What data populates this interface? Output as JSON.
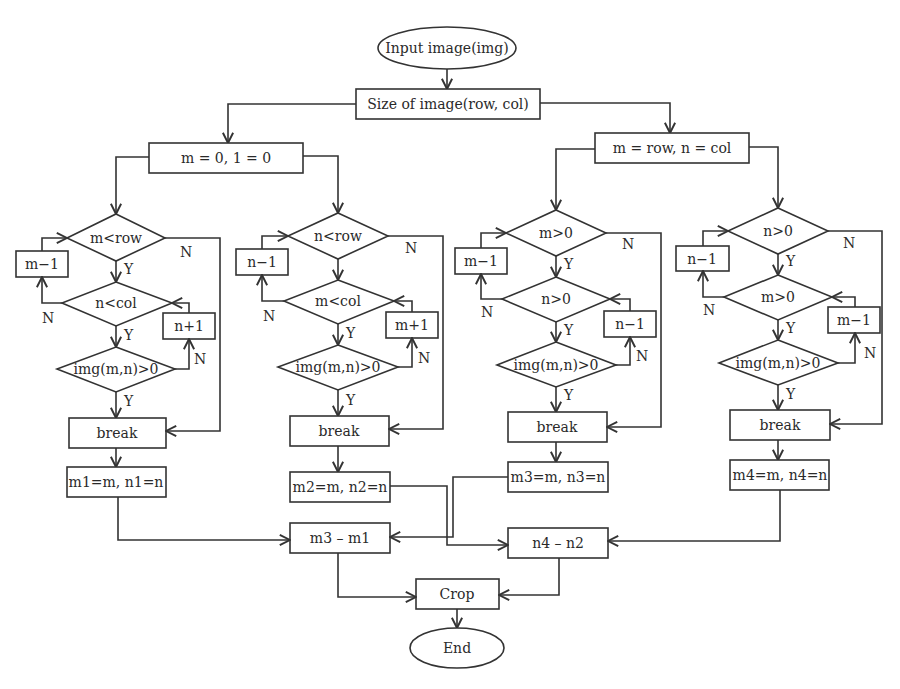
{
  "diagram": {
    "type": "flowchart",
    "start": "Input image(img)",
    "size": "Size of image(row, col)",
    "init_left": "m = 0, 1 = 0",
    "init_right": "m = row, n = col",
    "branches": [
      {
        "cond1": "m<row",
        "dec1": "m−1",
        "cond2": "n<col",
        "inc2": "n+1",
        "cond3": "img(m,n)>0",
        "break": "break",
        "result": "m1=m, n1=n"
      },
      {
        "cond1": "n<row",
        "dec1": "n−1",
        "cond2": "m<col",
        "inc2": "m+1",
        "cond3": "img(m,n)>0",
        "break": "break",
        "result": "m2=m, n2=n"
      },
      {
        "cond1": "m>0",
        "dec1": "m−1",
        "cond2": "n>0",
        "inc2": "n−1",
        "cond3": "img(m,n)>0",
        "break": "break",
        "result": "m3=m, n3=n"
      },
      {
        "cond1": "n>0",
        "dec1": "n−1",
        "cond2": "m>0",
        "inc2": "m−1",
        "cond3": "img(m,n)>0",
        "break": "break",
        "result": "m4=m, n4=n"
      }
    ],
    "diff_m": "m3 – m1",
    "diff_n": "n4 – n2",
    "crop": "Crop",
    "end": "End",
    "yes": "Y",
    "no": "N"
  }
}
